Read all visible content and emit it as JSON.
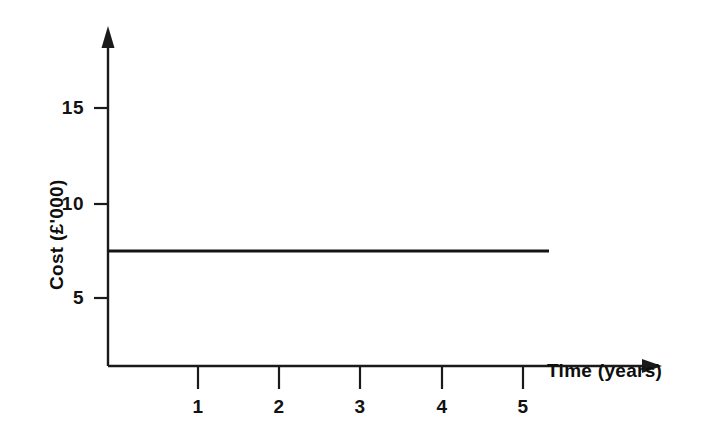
{
  "chart_data": {
    "type": "line",
    "title": "",
    "subtitle": "",
    "xlabel": "Time (years)",
    "ylabel": "Cost (£'000)",
    "x": [
      0,
      1,
      2,
      3,
      4,
      5
    ],
    "series": [
      {
        "name": "Cost",
        "values": [
          7.5,
          7.5,
          7.5,
          7.5,
          7.5,
          7.5
        ]
      }
    ],
    "xticks": [
      1,
      2,
      3,
      4,
      5
    ],
    "xtick_labels": [
      "1",
      "2",
      "3",
      "4",
      "5"
    ],
    "yticks": [
      5,
      10,
      15
    ],
    "ytick_labels": [
      "5",
      "10",
      "15"
    ],
    "xlim": [
      0,
      5.3
    ],
    "ylim": [
      0,
      17.5
    ],
    "grid": false,
    "legend": false,
    "legend_position": "none",
    "annotations": [],
    "line_color": "#141414",
    "axis_color": "#1a1a1a",
    "background_color": "#ffffff"
  },
  "axes": {
    "y_title": "Cost (£'000)",
    "x_title": "Time (years)",
    "y_ticks": [
      {
        "label": "15",
        "value": 15
      },
      {
        "label": "10",
        "value": 10
      },
      {
        "label": "5",
        "value": 5
      }
    ],
    "x_ticks": [
      {
        "label": "1",
        "value": 1
      },
      {
        "label": "2",
        "value": 2
      },
      {
        "label": "3",
        "value": 3
      },
      {
        "label": "4",
        "value": 4
      },
      {
        "label": "5",
        "value": 5
      }
    ]
  }
}
